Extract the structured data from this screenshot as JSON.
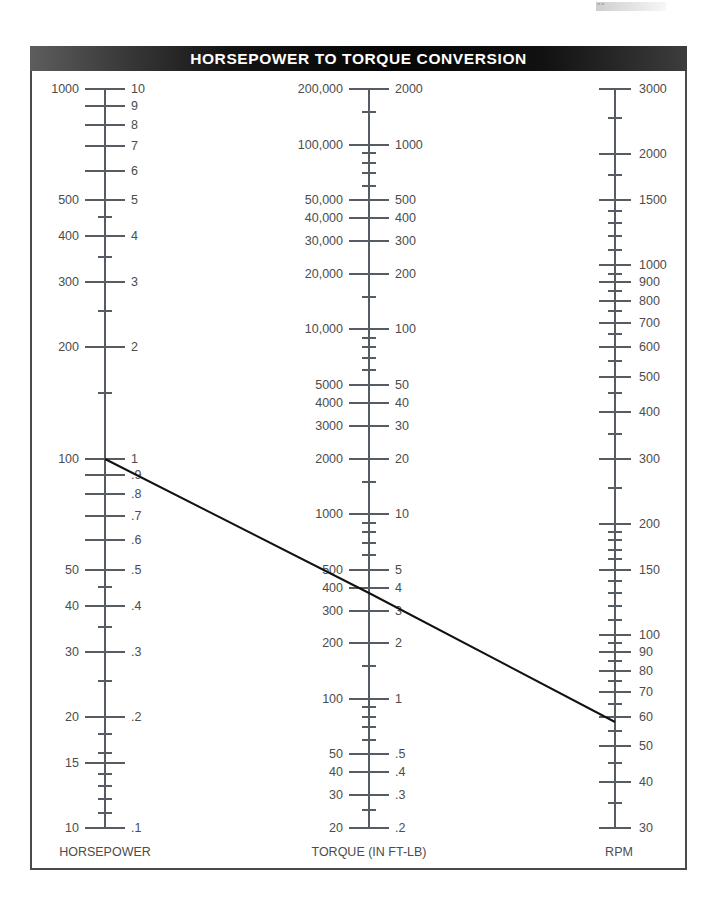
{
  "header": {
    "title": "HORSEPOWER TO TORQUE CONVERSION"
  },
  "artifact": {
    "mark": "\"\""
  },
  "axes": {
    "horsepower": {
      "caption": "HORSEPOWER"
    },
    "torque": {
      "caption": "TORQUE (IN FT-LB)"
    },
    "rpm": {
      "caption": "RPM"
    }
  },
  "chart_data": {
    "type": "line",
    "title": "HORSEPOWER TO TORQUE CONVERSION",
    "subtype": "nomograph",
    "grid": false,
    "legend": "none",
    "axis_scale": "logarithmic",
    "axes": [
      {
        "name": "horsepower",
        "caption": "HORSEPOWER",
        "x_px": 105,
        "top_px": 89,
        "bottom_px": 828,
        "range_left": [
          10,
          1000
        ],
        "range_right": [
          0.1,
          10
        ],
        "left_labels": [
          "1000",
          "500",
          "400",
          "300",
          "200",
          "100",
          "50",
          "40",
          "30",
          "20",
          "15",
          "10"
        ],
        "left_values": [
          1000,
          500,
          400,
          300,
          200,
          100,
          50,
          40,
          30,
          20,
          15,
          10
        ],
        "right_labels": [
          "10",
          "9",
          "8",
          "7",
          "6",
          "5",
          "4",
          "3",
          "2",
          "1",
          ".9",
          ".8",
          ".7",
          ".6",
          ".5",
          ".4",
          ".3",
          ".2",
          ".1"
        ],
        "right_values": [
          10,
          9,
          8,
          7,
          6,
          5,
          4,
          3,
          2,
          1,
          0.9,
          0.8,
          0.7,
          0.6,
          0.5,
          0.4,
          0.3,
          0.2,
          0.1
        ],
        "minor_values": [
          900,
          800,
          700,
          600,
          450,
          350,
          250,
          150,
          90,
          80,
          70,
          60,
          45,
          35,
          25,
          18,
          16,
          14,
          13,
          12,
          11
        ]
      },
      {
        "name": "torque",
        "caption": "TORQUE (IN FT-LB)",
        "x_px": 369,
        "top_px": 89,
        "bottom_px": 828,
        "range_left": [
          20,
          200000
        ],
        "range_right": [
          0.2,
          2000
        ],
        "left_labels": [
          "200,000",
          "100,000",
          "50,000",
          "40,000",
          "30,000",
          "20,000",
          "10,000",
          "5000",
          "4000",
          "3000",
          "2000",
          "1000",
          "500",
          "400",
          "300",
          "200",
          "100",
          "50",
          "40",
          "30",
          "20"
        ],
        "left_values": [
          200000,
          100000,
          50000,
          40000,
          30000,
          20000,
          10000,
          5000,
          4000,
          3000,
          2000,
          1000,
          500,
          400,
          300,
          200,
          100,
          50,
          40,
          30,
          20
        ],
        "right_labels": [
          "2000",
          "1000",
          "500",
          "400",
          "300",
          "200",
          "100",
          "50",
          "40",
          "30",
          "20",
          "10",
          "5",
          "4",
          "3",
          "2",
          "1",
          ".5",
          ".4",
          ".3",
          ".2"
        ],
        "right_values": [
          2000,
          1000,
          500,
          400,
          300,
          200,
          100,
          50,
          40,
          30,
          20,
          10,
          5,
          4,
          3,
          2,
          1,
          0.5,
          0.4,
          0.3,
          0.2
        ],
        "minor_values": [
          150000,
          90000,
          80000,
          70000,
          60000,
          15000,
          9000,
          8000,
          7000,
          6000,
          1500,
          900,
          800,
          700,
          600,
          150,
          90,
          80,
          70,
          60,
          25
        ]
      },
      {
        "name": "rpm",
        "caption": "RPM",
        "x_px": 615,
        "top_px": 89,
        "bottom_px": 828,
        "range": [
          30,
          3000
        ],
        "labels": [
          "30",
          "40",
          "50",
          "60",
          "70",
          "80",
          "90",
          "100",
          "150",
          "200",
          "300",
          "400",
          "500",
          "600",
          "700",
          "800",
          "900",
          "1000",
          "1500",
          "2000",
          "3000"
        ],
        "values": [
          30,
          40,
          50,
          60,
          70,
          80,
          90,
          100,
          150,
          200,
          300,
          400,
          500,
          600,
          700,
          800,
          900,
          1000,
          1500,
          2000,
          3000
        ],
        "minor_values": [
          35,
          45,
          55,
          65,
          75,
          85,
          95,
          110,
          120,
          130,
          140,
          160,
          170,
          180,
          190,
          250,
          350,
          450,
          550,
          650,
          750,
          850,
          950,
          1100,
          1200,
          1300,
          1400,
          1750,
          2500
        ]
      }
    ],
    "isopleth": {
      "description": "Example solution line connecting horsepower, torque and rpm",
      "points": [
        {
          "axis": "horsepower",
          "value": 100,
          "secondary_value": 1,
          "x_px": 105,
          "y_px": 459
        },
        {
          "axis": "torque",
          "value": 300,
          "secondary_value": 3,
          "x_px": 369,
          "y_px": 593
        },
        {
          "axis": "rpm",
          "value": 1750,
          "x_px": 615,
          "y_px": 722
        }
      ],
      "color": "#111111",
      "width_px": 2
    }
  },
  "colors": {
    "header_bg": "#0a0a0a",
    "header_text": "#ffffff",
    "frame_border": "#4a4a4a",
    "axis": "#555c63",
    "label_text": "#4c4c4c",
    "isopleth": "#111111",
    "page_bg": "#ffffff"
  }
}
